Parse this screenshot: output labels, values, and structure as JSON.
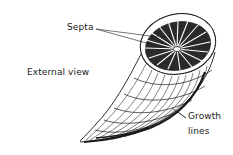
{
  "diagram": {
    "labels": {
      "septa": "Septa",
      "external_view": "External view",
      "growth_line1": "Growth",
      "growth_line2": "lines"
    },
    "colors": {
      "ink": "#1a1a1a",
      "background": "#ffffff"
    }
  }
}
